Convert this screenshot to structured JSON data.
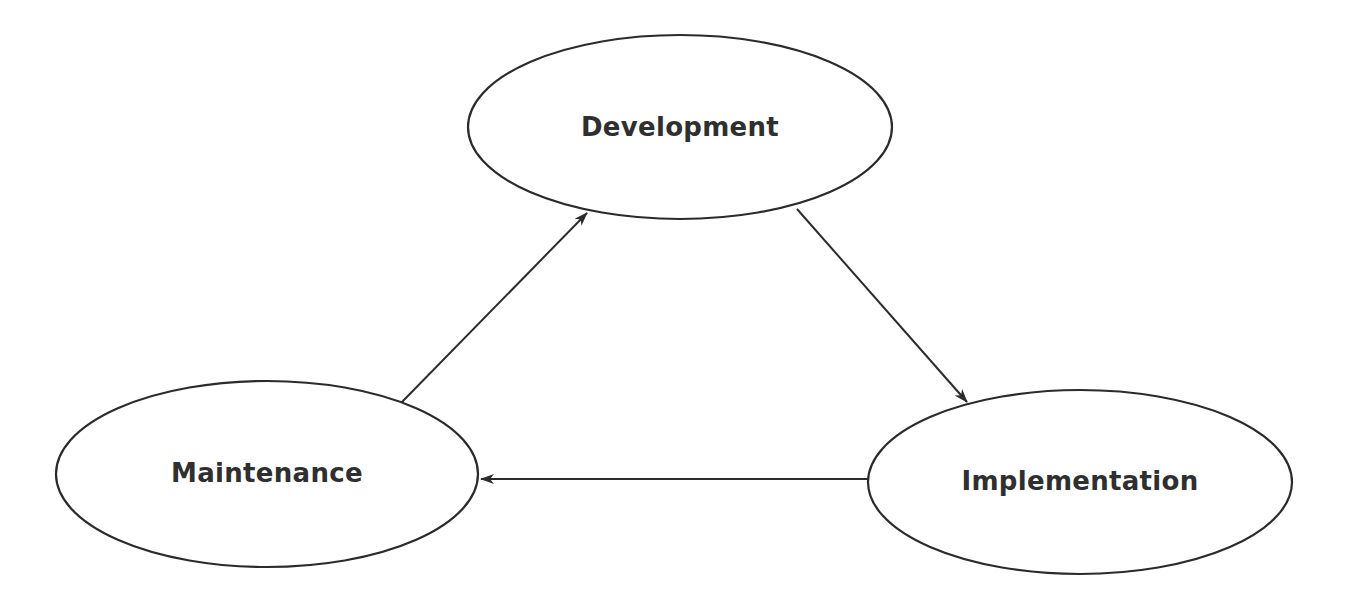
{
  "diagram": {
    "type": "cycle",
    "nodes": [
      {
        "id": "development",
        "label": "Development",
        "cx": 680,
        "cy": 127,
        "rx": 212,
        "ry": 92
      },
      {
        "id": "implementation",
        "label": "Implementation",
        "cx": 1080,
        "cy": 482,
        "rx": 212,
        "ry": 92
      },
      {
        "id": "maintenance",
        "label": "Maintenance",
        "cx": 267,
        "cy": 474,
        "rx": 211,
        "ry": 93
      }
    ],
    "edges": [
      {
        "from": "maintenance",
        "to": "development",
        "x1": 401,
        "y1": 403,
        "x2": 587,
        "y2": 213
      },
      {
        "from": "development",
        "to": "implementation",
        "x1": 797,
        "y1": 209,
        "x2": 967,
        "y2": 402
      },
      {
        "from": "implementation",
        "to": "maintenance",
        "x1": 868,
        "y1": 479,
        "x2": 481,
        "y2": 479
      }
    ],
    "colors": {
      "stroke": "#2b2b2b",
      "text": "#2f2f2f",
      "background": "#ffffff"
    }
  }
}
